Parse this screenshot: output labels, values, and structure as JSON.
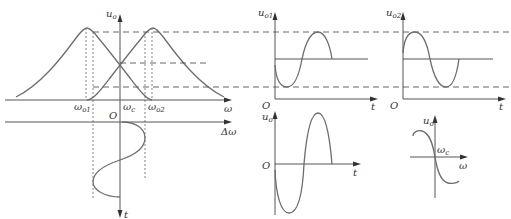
{
  "diagram": {
    "type": "frequency-discriminator-waveforms",
    "colors": {
      "curve": "#6d6d6d",
      "axis": "#555555",
      "text": "#333333"
    },
    "main_plot": {
      "y_axis_label": "u",
      "y_axis_sub": "o",
      "x_axis_label": "ω",
      "tick_labels": [
        {
          "main": "ω",
          "sub": "o1"
        },
        {
          "main": "ω",
          "sub": "c"
        },
        {
          "main": "ω",
          "sub": "o2"
        }
      ],
      "curves": [
        "resonance curve centered at ω_o1",
        "resonance curve centered at ω_o2"
      ]
    },
    "input_plot": {
      "origin": "O",
      "x_axis_label": "Δω",
      "y_axis_label": "t"
    },
    "uo1_plot": {
      "y_axis_label": "u",
      "y_axis_sub": "o1",
      "origin": "O",
      "x_axis_label": "t"
    },
    "uo2_plot": {
      "y_axis_label": "u",
      "y_axis_sub": "o2",
      "origin": "O",
      "x_axis_label": "t"
    },
    "uo_plot": {
      "y_axis_label": "u",
      "y_axis_sub": "o",
      "origin": "O",
      "x_axis_label": "t"
    },
    "s_curve_plot": {
      "y_axis_label": "u",
      "y_axis_sub": "o",
      "center_label": "ω",
      "center_sub": "c",
      "x_axis_label": "ω"
    }
  }
}
